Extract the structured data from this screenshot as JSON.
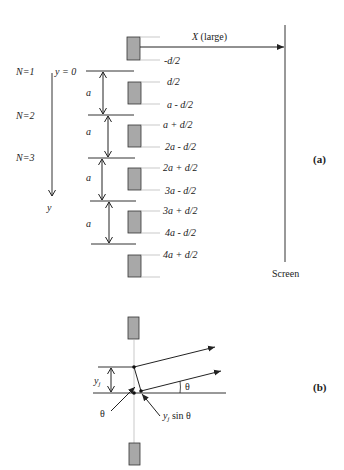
{
  "figure": {
    "part_a": {
      "label": "(a)",
      "distance_label": "X (large)",
      "distance_var": "X",
      "distance_suffix": "(large)",
      "screen_label": "Screen",
      "y_origin_label": "y = 0",
      "y_axis_label": "y",
      "spacing_label": "a",
      "n_labels": [
        "N=1",
        "N=2",
        "N=3"
      ],
      "slit_edge_labels": [
        "-d/2",
        "d/2",
        "a - d/2",
        "a + d/2",
        "2a - d/2",
        "2a + d/2",
        "3a - d/2",
        "3a + d/2",
        "4a - d/2",
        "4a + d/2"
      ]
    },
    "part_b": {
      "label": "(b)",
      "offset_label": "y",
      "offset_subscript": "j",
      "angle_label": "θ",
      "path_diff_label_prefix": "y",
      "path_diff_subscript": "j",
      "path_diff_suffix": " sin θ"
    },
    "colors": {
      "slit_fill": "#a8a8a8",
      "slit_stroke": "#333333",
      "line": "#222222",
      "guide": "#bbbbbb"
    }
  }
}
